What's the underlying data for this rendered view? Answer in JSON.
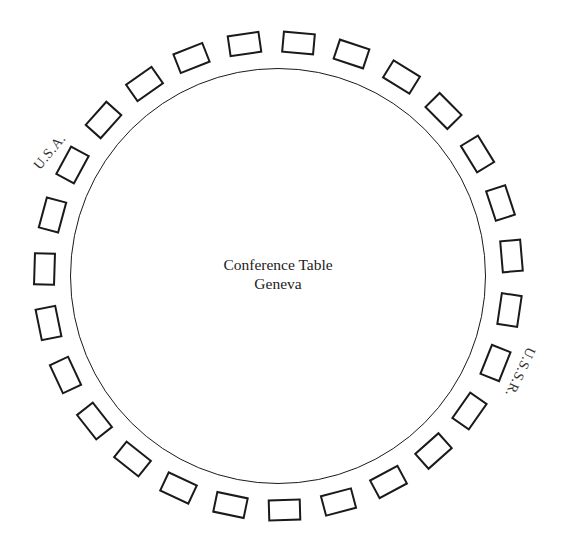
{
  "diagram": {
    "table": {
      "title": "Conference Table",
      "location": "Geneva",
      "center": [
        278,
        276
      ],
      "radius": 208
    },
    "chairs": {
      "count": 27,
      "start_angle_deg": 5.1,
      "ring_radius": 234
    },
    "delegations": [
      {
        "label": "U.S.A.",
        "x": 50,
        "y": 152,
        "rotation_deg": -50
      },
      {
        "label": "U.S.S.R.",
        "x": 520,
        "y": 372,
        "rotation_deg": 115
      }
    ],
    "colors": {
      "line": "#1a1a1a",
      "text": "#222222",
      "background": "#ffffff"
    }
  }
}
